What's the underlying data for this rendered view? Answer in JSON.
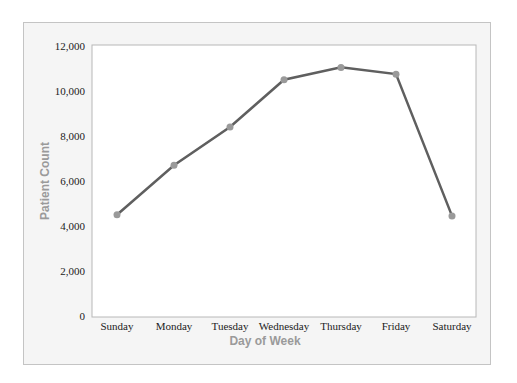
{
  "chart_data": {
    "type": "line",
    "title": "",
    "xlabel": "Day of  Week",
    "ylabel": "Patient Count",
    "categories": [
      "Sunday",
      "Monday",
      "Tuesday",
      "Wednesday",
      "Thursday",
      "Friday",
      "Saturday"
    ],
    "series": [
      {
        "name": "Patient Count",
        "values": [
          4500,
          6700,
          8400,
          10500,
          11050,
          10750,
          4450
        ],
        "color": "#5f5f5f",
        "marker_color": "#9a9a9a"
      }
    ],
    "ylim": [
      0,
      12000
    ],
    "yticks": [
      "0",
      "2,000",
      "4,000",
      "6,000",
      "8,000",
      "10,000",
      "12,000"
    ],
    "grid": false,
    "legend": "none"
  }
}
